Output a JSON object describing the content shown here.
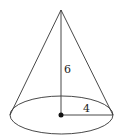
{
  "diagram": {
    "type": "right-circular-cone",
    "height_label": "6",
    "radius_label": "4",
    "stroke_color": "#333333",
    "background": "#ffffff",
    "apex": [
      61,
      10
    ],
    "base_center": [
      61,
      115
    ],
    "base_rx": 52,
    "base_ry": 19
  }
}
